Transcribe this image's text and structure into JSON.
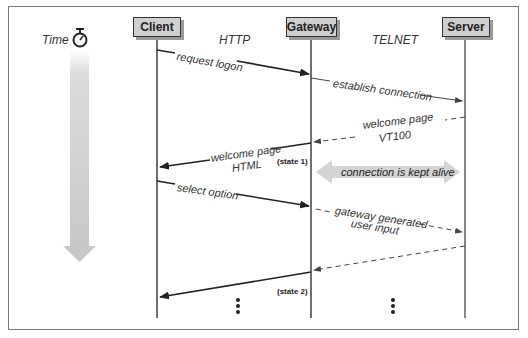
{
  "time": {
    "label": "Time",
    "icon": "stopwatch-icon"
  },
  "actors": [
    {
      "name": "Client"
    },
    {
      "name": "Gateway"
    },
    {
      "name": "Server"
    }
  ],
  "protocols": {
    "left": "HTTP",
    "right": "TELNET"
  },
  "messages": [
    {
      "from": "Client",
      "to": "Gateway",
      "style": "solid",
      "label": "request logon"
    },
    {
      "from": "Gateway",
      "to": "Server",
      "style": "solid",
      "label": "establish connection"
    },
    {
      "from": "Server",
      "to": "Gateway",
      "style": "dashed",
      "label_line1": "welcome page",
      "label_line2": "VT100"
    },
    {
      "from": "Gateway",
      "to": "Client",
      "style": "solid",
      "label_line1": "welcome page",
      "label_line2": "HTML"
    },
    {
      "from": "Client",
      "to": "Gateway",
      "style": "solid",
      "label": "select option"
    },
    {
      "from": "Gateway",
      "to": "Server",
      "style": "dashed",
      "label_line1": "gateway generated",
      "label_line2": "user input"
    },
    {
      "from": "Server",
      "to": "Gateway",
      "style": "dashed",
      "label": ""
    },
    {
      "from": "Gateway",
      "to": "Client",
      "style": "solid",
      "label": ""
    }
  ],
  "states": {
    "state1": "(state 1)",
    "state2": "(state 2)"
  },
  "keepalive": {
    "label": "connection is kept alive"
  },
  "colors": {
    "actor_fill": "#cfcfcf",
    "arrow_gray": "#d4d4d4",
    "line": "#222222"
  }
}
